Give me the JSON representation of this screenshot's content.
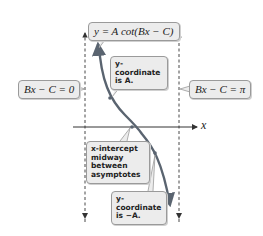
{
  "diagram": {
    "equation_label": "y = A cot(Bx − C)",
    "left_asymptote_label": "Bx − C = 0",
    "right_asymptote_label": "Bx − C = π",
    "x_axis_label": "x",
    "annotations": {
      "top_point": "y-coordinate is A.",
      "x_intercept": "x-intercept midway between asymptotes",
      "bottom_point": "y-coordinate is −A."
    },
    "colors": {
      "curve": "#5a6470",
      "box_fill": "#ececec",
      "box_border": "#9a9a9a",
      "axis": "#333333"
    }
  }
}
